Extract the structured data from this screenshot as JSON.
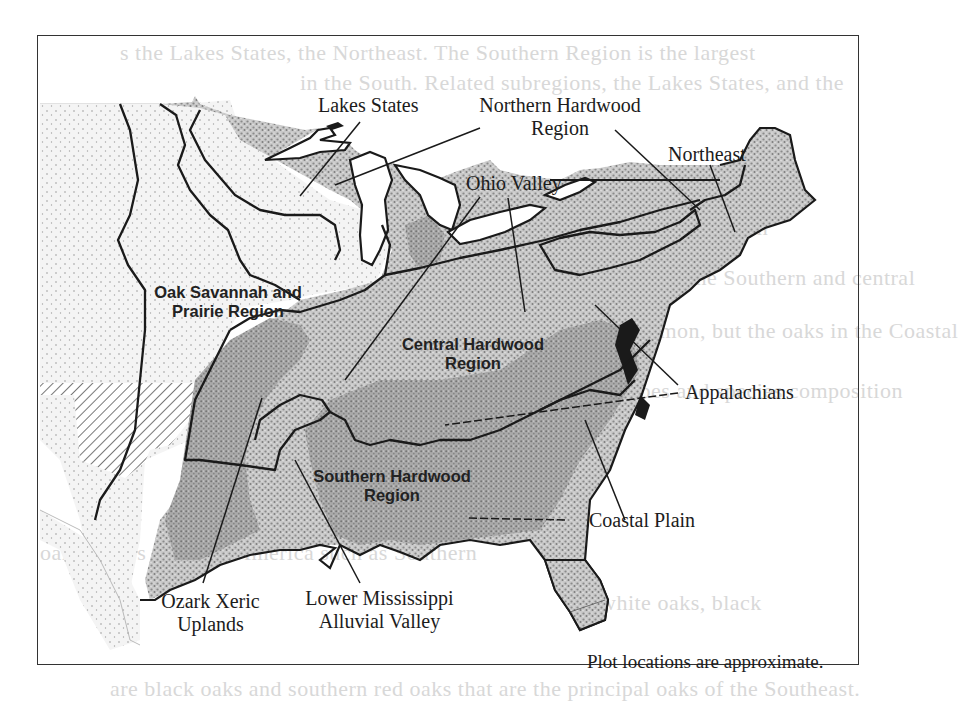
{
  "figure": {
    "type": "map",
    "note": "Plot locations are approximate.",
    "fill_color": "#9a9a9a",
    "boundary_color": "#1a1a1a",
    "hatch_color": "#555555"
  },
  "labels": {
    "lakes_states": "Lakes States",
    "northern_hardwood_line1": "Northern Hardwood",
    "northern_hardwood_line2": "Region",
    "northeast": "Northeast",
    "ohio_valley": "Ohio Valley",
    "oak_savannah_line1": "Oak Savannah and",
    "oak_savannah_line2": "Prairie Region",
    "central_hardwood_line1": "Central Hardwood",
    "central_hardwood_line2": "Region",
    "appalachians": "Appalachians",
    "southern_hardwood_line1": "Southern Hardwood",
    "southern_hardwood_line2": "Region",
    "coastal_plain": "Coastal Plain",
    "ozark_line1": "Ozark Xeric",
    "ozark_line2": "Uplands",
    "lower_miss_line1": "Lower Mississippi",
    "lower_miss_line2": "Alluvial Valley"
  },
  "regions": [
    {
      "name": "Lakes States",
      "group": "Northern Hardwood Region"
    },
    {
      "name": "Northeast",
      "group": "Northern Hardwood Region"
    },
    {
      "name": "Oak Savannah and Prairie Region",
      "group": "Oak Savannah and Prairie Region"
    },
    {
      "name": "Ohio Valley",
      "group": "Central Hardwood Region"
    },
    {
      "name": "Appalachians",
      "group": "Central Hardwood Region"
    },
    {
      "name": "Ozark Xeric Uplands",
      "group": "Southern Hardwood Region"
    },
    {
      "name": "Lower Mississippi Alluvial Valley",
      "group": "Southern Hardwood Region"
    },
    {
      "name": "Coastal Plain",
      "group": "Southern Hardwood Region"
    }
  ]
}
